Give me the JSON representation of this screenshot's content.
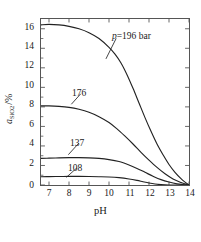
{
  "chart_data": {
    "type": "line",
    "title": "",
    "xlabel": "pH",
    "ylabel": "a_SiO2 /%",
    "ylabel_parts": {
      "symbol": "a",
      "subscript": "SiO",
      "subscript2": "2",
      "unit": "/%"
    },
    "xlim": [
      6.6,
      14
    ],
    "ylim": [
      0,
      17
    ],
    "xticks": [
      7,
      8,
      9,
      10,
      11,
      12,
      13,
      14
    ],
    "yticks": [
      0,
      2,
      4,
      6,
      8,
      10,
      12,
      14,
      16
    ],
    "grid": false,
    "legend_position": "inline-annotations",
    "line_color": "#222222",
    "frame_color": "#555555",
    "series": [
      {
        "name": "196",
        "label": "p=196 bar",
        "label_prefix_italic": "p",
        "label_rest": "=196  bar",
        "x": [
          6.6,
          7.0,
          7.5,
          8.0,
          8.5,
          9.0,
          9.5,
          10.0,
          10.3,
          10.6,
          10.9,
          11.2,
          11.5,
          11.8,
          12.1,
          12.4,
          12.7,
          13.0,
          13.3,
          13.6,
          13.8,
          14.0
        ],
        "values": [
          16.4,
          16.45,
          16.4,
          16.25,
          16.0,
          15.6,
          15.0,
          14.1,
          13.4,
          12.5,
          11.3,
          9.9,
          8.4,
          6.9,
          5.5,
          4.2,
          3.1,
          2.1,
          1.3,
          0.65,
          0.3,
          0.0
        ]
      },
      {
        "name": "176",
        "label": "176",
        "x": [
          6.6,
          7.0,
          7.5,
          8.0,
          8.5,
          9.0,
          9.5,
          10.0,
          10.4,
          10.8,
          11.2,
          11.6,
          12.0,
          12.4,
          12.8,
          13.2,
          13.6,
          13.8,
          14.0
        ],
        "values": [
          8.1,
          8.1,
          8.05,
          7.95,
          7.75,
          7.45,
          7.0,
          6.4,
          5.75,
          5.0,
          4.2,
          3.35,
          2.55,
          1.8,
          1.15,
          0.62,
          0.25,
          0.12,
          0.0
        ]
      },
      {
        "name": "137",
        "label": "137",
        "x": [
          6.6,
          7.0,
          7.5,
          8.0,
          8.5,
          9.0,
          9.5,
          10.0,
          10.5,
          11.0,
          11.4,
          11.8,
          12.2,
          12.6,
          13.0,
          13.4,
          13.7,
          14.0
        ],
        "values": [
          2.72,
          2.75,
          2.78,
          2.8,
          2.8,
          2.78,
          2.72,
          2.6,
          2.4,
          2.05,
          1.7,
          1.3,
          0.9,
          0.55,
          0.3,
          0.12,
          0.05,
          0.0
        ]
      },
      {
        "name": "108",
        "label": "108",
        "x": [
          6.6,
          7.0,
          7.5,
          8.0,
          8.5,
          9.0,
          9.5,
          10.0,
          10.5,
          11.0,
          11.4,
          11.7,
          12.0,
          12.3,
          12.6,
          13.0,
          13.4,
          14.0
        ],
        "values": [
          0.85,
          0.86,
          0.87,
          0.88,
          0.88,
          0.87,
          0.85,
          0.82,
          0.75,
          0.62,
          0.47,
          0.33,
          0.2,
          0.1,
          0.04,
          0.0,
          0.0,
          0.0
        ]
      }
    ],
    "annotations": [
      {
        "text": "p=196 bar",
        "series": "196"
      },
      {
        "text": "176",
        "series": "176"
      },
      {
        "text": "137",
        "series": "137"
      },
      {
        "text": "108",
        "series": "108"
      }
    ]
  },
  "axis": {
    "x_ticklabels": [
      "7",
      "8",
      "9",
      "10",
      "11",
      "12",
      "13",
      "14"
    ],
    "y_ticklabels": [
      "0",
      "2",
      "4",
      "6",
      "8",
      "10",
      "12",
      "14",
      "16"
    ],
    "x_title": "pH",
    "y_symbol": "a",
    "y_sub": "SiO",
    "y_sub2": "2",
    "y_unit": "/%"
  },
  "labels": {
    "p196_italic": "p",
    "p196_rest": "=196  bar",
    "c176": "176",
    "c137": "137",
    "c108": "108"
  }
}
